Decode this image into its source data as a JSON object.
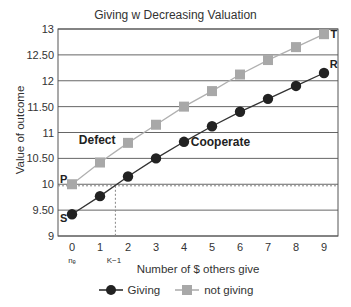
{
  "chart_data": {
    "type": "line",
    "title": "Giving w Decreasing Valuation",
    "xlabel": "Number of $ others give",
    "ylabel": "Value of outcome",
    "x": [
      0,
      1,
      2,
      3,
      4,
      5,
      6,
      7,
      8,
      9
    ],
    "x_tick_labels": [
      "0",
      "1",
      "2",
      "3",
      "4",
      "5",
      "6",
      "7",
      "8",
      "9"
    ],
    "x_sub_labels": [
      {
        "x": 0,
        "label": "nₑ"
      },
      {
        "x": 1.5,
        "label": "K−1"
      }
    ],
    "y_ticks": [
      9,
      9.5,
      10,
      10.5,
      11,
      11.5,
      12,
      12.5,
      13
    ],
    "y_tick_labels": [
      "9",
      "9.50",
      "10",
      "10.50",
      "11",
      "11.50",
      "12",
      "12.50",
      "13"
    ],
    "ylim": [
      9,
      13
    ],
    "xlim": [
      -0.5,
      9.5
    ],
    "grid": "horizontal",
    "series": [
      {
        "name": "Giving",
        "color": "#222222",
        "marker": "circle",
        "values": [
          9.42,
          9.77,
          10.15,
          10.5,
          10.82,
          11.12,
          11.4,
          11.65,
          11.9,
          12.15
        ]
      },
      {
        "name": "not giving",
        "color": "#a8a8a8",
        "marker": "square",
        "values": [
          10.0,
          10.42,
          10.8,
          11.15,
          11.5,
          11.8,
          12.12,
          12.4,
          12.65,
          12.9
        ]
      }
    ],
    "annotations": [
      {
        "text": "Defect",
        "x": 0.9,
        "y": 10.85,
        "bold": true
      },
      {
        "text": "Cooperate",
        "x": 5.3,
        "y": 10.82,
        "bold": true
      },
      {
        "text": "P",
        "x": -0.3,
        "y": 10.1
      },
      {
        "text": "S",
        "x": -0.3,
        "y": 9.35
      },
      {
        "text": "T",
        "x": 9.35,
        "y": 12.9
      },
      {
        "text": "R",
        "x": 9.35,
        "y": 12.32
      }
    ],
    "reference_lines": [
      {
        "type": "horizontal",
        "y": 9.97,
        "style": "dashed"
      },
      {
        "type": "vertical",
        "x": 1.55,
        "style": "dashed",
        "from": 9,
        "to": 9.97
      }
    ],
    "legend": {
      "position": "bottom",
      "entries": [
        "Giving",
        "not giving"
      ]
    }
  }
}
